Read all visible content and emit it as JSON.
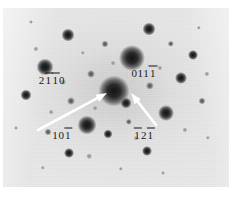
{
  "figure": {
    "type": "electron-diffraction-pattern",
    "background_color": "#ffffff",
    "plate_color": "#e8e8e8",
    "spot_color": "#141414",
    "arrow_color": "#ffffff",
    "label_color": "#121212"
  },
  "labels": [
    {
      "id": "label-2-1bar-1bar-0",
      "name": "reflection-label-2110",
      "text": "2110",
      "digits": [
        {
          "ch": "2",
          "bar": false
        },
        {
          "ch": "1",
          "bar": true
        },
        {
          "ch": "1",
          "bar": true
        },
        {
          "ch": "0",
          "bar": false
        }
      ],
      "x": 49,
      "y": 72
    },
    {
      "id": "label-0-1-1-1bar",
      "name": "reflection-label-0111",
      "text": "0111",
      "digits": [
        {
          "ch": "0",
          "bar": false
        },
        {
          "ch": "1",
          "bar": false
        },
        {
          "ch": "1",
          "bar": false
        },
        {
          "ch": "1",
          "bar": true
        }
      ],
      "x": 141,
      "y": 65
    },
    {
      "id": "label-1-0-1bar",
      "name": "reflection-label-101",
      "text": "101",
      "digits": [
        {
          "ch": "1",
          "bar": false
        },
        {
          "ch": "0",
          "bar": false
        },
        {
          "ch": "1",
          "bar": true
        }
      ],
      "x": 59,
      "y": 127
    },
    {
      "id": "label-1bar-2-1bar",
      "name": "reflection-label-121",
      "text": "121",
      "digits": [
        {
          "ch": "1",
          "bar": true
        },
        {
          "ch": "2",
          "bar": false
        },
        {
          "ch": "1",
          "bar": true
        }
      ],
      "x": 141,
      "y": 127
    }
  ],
  "arrows": [
    {
      "name": "arrow-to-101",
      "from_x": 35,
      "from_y": 122,
      "to_x": 104,
      "to_y": 85,
      "points_to": "101"
    },
    {
      "name": "arrow-to-121",
      "from_x": 153,
      "from_y": 117,
      "to_x": 128,
      "to_y": 85,
      "points_to": "121"
    }
  ],
  "spots": [
    {
      "x": 111,
      "y": 83,
      "r": 15.5,
      "c": "strong"
    },
    {
      "x": 129,
      "y": 50,
      "r": 13.0,
      "c": "strong"
    },
    {
      "x": 42,
      "y": 59,
      "r": 8.5,
      "c": "strong"
    },
    {
      "x": 84,
      "y": 117,
      "r": 9.5,
      "c": "strong"
    },
    {
      "x": 163,
      "y": 105,
      "r": 8.0,
      "c": "strong"
    },
    {
      "x": 65,
      "y": 27,
      "r": 6.5,
      "c": "strong"
    },
    {
      "x": 146,
      "y": 21,
      "r": 6.5,
      "c": "strong"
    },
    {
      "x": 23,
      "y": 87,
      "r": 5.5,
      "c": "strong"
    },
    {
      "x": 178,
      "y": 70,
      "r": 6.0,
      "c": "strong"
    },
    {
      "x": 123,
      "y": 95,
      "r": 5.5,
      "c": "strong"
    },
    {
      "x": 66,
      "y": 145,
      "r": 5.0,
      "c": "strong"
    },
    {
      "x": 144,
      "y": 143,
      "r": 5.0,
      "c": "strong"
    },
    {
      "x": 105,
      "y": 126,
      "r": 4.5,
      "c": "strong"
    },
    {
      "x": 68,
      "y": 93,
      "r": 4.0,
      "c": "faint"
    },
    {
      "x": 88,
      "y": 66,
      "r": 4.0,
      "c": "faint"
    },
    {
      "x": 147,
      "y": 78,
      "r": 4.2,
      "c": "faint"
    },
    {
      "x": 190,
      "y": 47,
      "r": 5.0,
      "c": "strong"
    },
    {
      "x": 199,
      "y": 93,
      "r": 3.5,
      "c": "faint"
    },
    {
      "x": 45,
      "y": 124,
      "r": 3.5,
      "c": "faint"
    },
    {
      "x": 102,
      "y": 36,
      "r": 3.5,
      "c": "faint"
    },
    {
      "x": 168,
      "y": 36,
      "r": 3.2,
      "c": "faint"
    },
    {
      "x": 126,
      "y": 114,
      "r": 3.2,
      "c": "faint"
    },
    {
      "x": 86,
      "y": 148,
      "r": 2.8,
      "c": "vfaint"
    },
    {
      "x": 60,
      "y": 74,
      "r": 2.8,
      "c": "vfaint"
    },
    {
      "x": 33,
      "y": 41,
      "r": 2.6,
      "c": "vfaint"
    },
    {
      "x": 204,
      "y": 66,
      "r": 2.6,
      "c": "vfaint"
    },
    {
      "x": 182,
      "y": 122,
      "r": 2.6,
      "c": "vfaint"
    },
    {
      "x": 157,
      "y": 60,
      "r": 2.6,
      "c": "vfaint"
    },
    {
      "x": 110,
      "y": 55,
      "r": 2.4,
      "c": "vfaint"
    },
    {
      "x": 92,
      "y": 100,
      "r": 2.4,
      "c": "vfaint"
    },
    {
      "x": 48,
      "y": 104,
      "r": 2.4,
      "c": "vfaint"
    },
    {
      "x": 133,
      "y": 130,
      "r": 2.4,
      "c": "vfaint"
    },
    {
      "x": 40,
      "y": 160,
      "r": 2.2,
      "c": "vfaint"
    },
    {
      "x": 118,
      "y": 161,
      "r": 2.2,
      "c": "vfaint"
    },
    {
      "x": 205,
      "y": 130,
      "r": 2.2,
      "c": "vfaint"
    },
    {
      "x": 80,
      "y": 45,
      "r": 2.2,
      "c": "vfaint"
    },
    {
      "x": 196,
      "y": 20,
      "r": 2.2,
      "c": "vfaint"
    },
    {
      "x": 13,
      "y": 120,
      "r": 2.0,
      "c": "vfaint"
    },
    {
      "x": 160,
      "y": 165,
      "r": 2.0,
      "c": "vfaint"
    },
    {
      "x": 28,
      "y": 14,
      "r": 2.0,
      "c": "vfaint"
    }
  ]
}
